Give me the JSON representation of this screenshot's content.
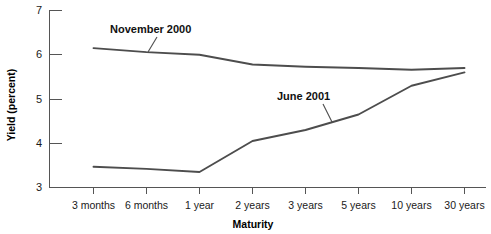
{
  "chart_data": {
    "type": "line",
    "title": "",
    "xlabel": "Maturity",
    "ylabel": "Yield (percent)",
    "categories": [
      "3 months",
      "6 months",
      "1 year",
      "2 years",
      "3 years",
      "5 years",
      "10 years",
      "30 years"
    ],
    "ylim": [
      3,
      7
    ],
    "y_ticks": [
      3,
      4,
      5,
      6,
      7
    ],
    "grid": false,
    "legend_position": "inline-annotations",
    "series": [
      {
        "name": "November 2000",
        "values": [
          6.15,
          6.06,
          6.0,
          5.78,
          5.73,
          5.7,
          5.66,
          5.7
        ],
        "color": "#4d4d4d",
        "annotation_label": "November 2000"
      },
      {
        "name": "June 2001",
        "values": [
          3.47,
          3.42,
          3.35,
          4.05,
          4.3,
          4.65,
          5.3,
          5.6
        ],
        "color": "#4d4d4d",
        "annotation_label": "June 2001"
      }
    ]
  },
  "axes": {
    "y_title": "Yield (percent)",
    "x_title": "Maturity",
    "y_tick_labels": [
      "7",
      "6",
      "5",
      "4",
      "3"
    ],
    "x_tick_labels": [
      "3 months",
      "6 months",
      "1 year",
      "2 years",
      "3 years",
      "5 years",
      "10 years",
      "30 years"
    ]
  },
  "annotations": {
    "november": "November 2000",
    "june": "June 2001"
  },
  "colors": {
    "line": "#4d4d4d",
    "axis": "#555555",
    "text": "#1a1a1a",
    "background": "#ffffff"
  }
}
